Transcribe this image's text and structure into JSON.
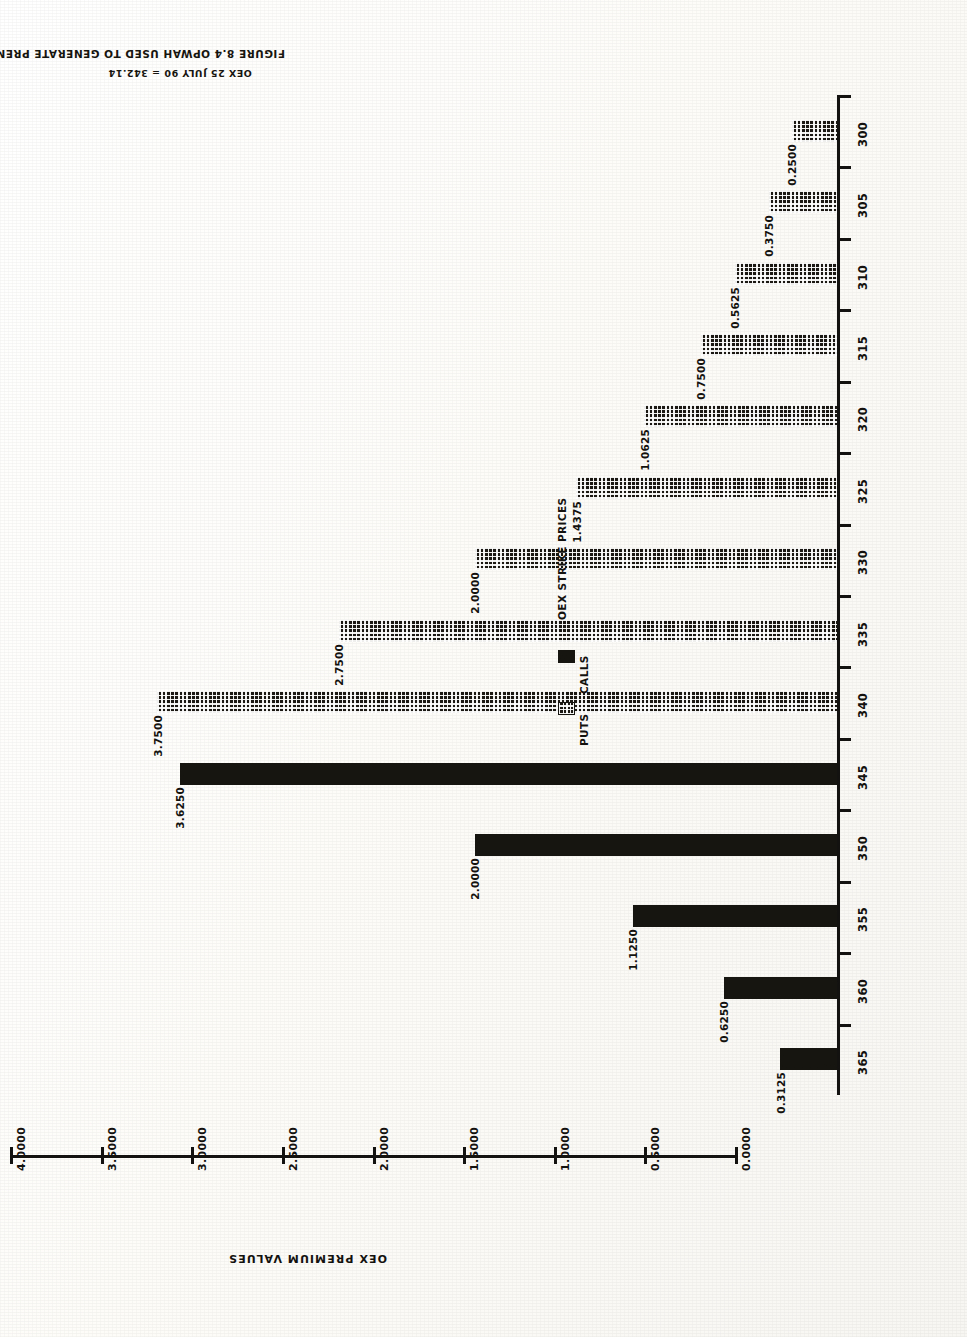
{
  "figure": {
    "title": "FIGURE 8.4 OPWAH USED TO GENERATE PREMIUMS",
    "subtitle": "OEX 25 JULY 90 = 342.14"
  },
  "chart_data": {
    "type": "bar",
    "orientation": "horizontal-rotated",
    "title": "FIGURE 8.4 OPWAH USED TO GENERATE PREMIUMS",
    "subtitle": "OEX 25 JULY 90 = 342.14",
    "xlabel": "OEX STRIKE PRICES",
    "ylabel": "OEX PREMIUM VALUES",
    "ylim": [
      0.0,
      4.0
    ],
    "ytick_labels": [
      "0.0000",
      "0.5000",
      "1.0000",
      "1.5000",
      "2.0000",
      "2.5000",
      "3.0000",
      "3.5000",
      "4.0000"
    ],
    "ytick_values": [
      0.0,
      0.5,
      1.0,
      1.5,
      2.0,
      2.5,
      3.0,
      3.5,
      4.0
    ],
    "grid": false,
    "legend_position": "center-right",
    "categories": [
      "300",
      "305",
      "310",
      "315",
      "320",
      "325",
      "330",
      "335",
      "340",
      "345",
      "350",
      "355",
      "360",
      "365"
    ],
    "series": [
      {
        "name": "PUTS",
        "fill": "stippled",
        "values": [
          0.25,
          0.375,
          0.5625,
          0.75,
          1.0625,
          1.4375,
          2.0,
          2.75,
          3.75,
          null,
          null,
          null,
          null,
          null
        ],
        "labels": [
          "0.2500",
          "0.3750",
          "0.5625",
          "0.7500",
          "1.0625",
          "1.4375",
          "2.0000",
          "2.7500",
          "3.7500",
          "",
          "",
          "",
          "",
          ""
        ]
      },
      {
        "name": "CALLS",
        "fill": "solid",
        "values": [
          null,
          null,
          null,
          null,
          null,
          null,
          null,
          null,
          null,
          3.625,
          2.0,
          1.125,
          0.625,
          0.3125
        ],
        "labels": [
          "",
          "",
          "",
          "",
          "",
          "",
          "",
          "",
          "",
          "3.6250",
          "2.0000",
          "1.1250",
          "0.6250",
          "0.3125"
        ]
      }
    ]
  },
  "legend": {
    "title": "OEX STRIKE PRICES",
    "items": [
      {
        "label": "CALLS",
        "swatch": "solid"
      },
      {
        "label": "PUTS",
        "swatch": "stippled"
      }
    ]
  },
  "axes": {
    "value_axis_title": "OEX PREMIUM VALUES",
    "category_axis_title": "OEX STRIKE PRICES"
  },
  "colors": {
    "ink": "#17150f",
    "paper": "#fdfcf9"
  }
}
